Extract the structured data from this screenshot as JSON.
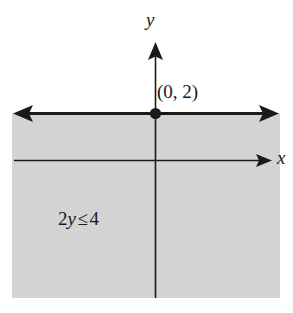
{
  "figure": {
    "kind": "coordinate-plane-inequality-graph",
    "axes": {
      "y_label": "y",
      "x_label": "x"
    },
    "annotations": {
      "intercept_label": "(0, 2)",
      "inequality_coefficient": "2",
      "inequality_variable": "y",
      "inequality_relation": "≤",
      "inequality_constant": "4",
      "inequality_full": "2y ≤ 4"
    },
    "colors": {
      "shading": "#d6d6d6",
      "ink": "#1a1a1a",
      "background": "#ffffff"
    },
    "geometry": {
      "boundary_line_y": 113,
      "x_axis_y": 160,
      "y_axis_x": 155,
      "shaded_left": 12,
      "shaded_right": 280,
      "shaded_top": 113,
      "shaded_bottom": 298
    }
  }
}
